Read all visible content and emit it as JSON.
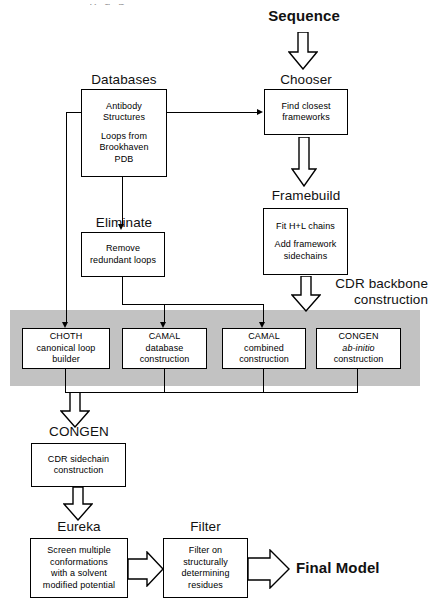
{
  "diagram": {
    "grey_band_label": "CDR backbone\nconstruction",
    "colors": {
      "band": "#c2c2c2",
      "line": "#000000",
      "box_fill": "#ffffff",
      "text": "#000000"
    }
  },
  "start": {
    "label": "Sequence"
  },
  "end": {
    "label": "Final Model"
  },
  "band": {
    "label_line1": "CDR backbone",
    "label_line2": "construction"
  },
  "stages": {
    "databases": {
      "caption": "Databases",
      "body_line1": "Antibody",
      "body_line2": "Structures",
      "body_line3": "Loops from",
      "body_line4": "Brookhaven",
      "body_line5": "PDB"
    },
    "chooser": {
      "caption": "Chooser",
      "body_line1": "Find closest",
      "body_line2": "frameworks"
    },
    "framebuild": {
      "caption": "Framebuild",
      "body_line1": "Fit H+L chains",
      "body_line2": "Add framework",
      "body_line3": "sidechains"
    },
    "eliminate": {
      "caption": "Eliminate",
      "body_line1": "Remove",
      "body_line2": "redundant loops"
    },
    "choth": {
      "body_line1": "CHOTH",
      "body_line2": "canonical loop",
      "body_line3": "builder"
    },
    "camal_database": {
      "body_line1": "CAMAL",
      "body_line2": "database",
      "body_line3": "construction"
    },
    "camal_combined": {
      "body_line1": "CAMAL",
      "body_line2": "combined",
      "body_line3": "construction"
    },
    "congen_abinitio": {
      "body_line1": "CONGEN",
      "body_line2": "ab-initio",
      "body_line3": "construction"
    },
    "congen_sidechain": {
      "caption": "CONGEN",
      "body_line1": "CDR sidechain",
      "body_line2": "construction"
    },
    "eureka": {
      "caption": "Eureka",
      "body_line1": "Screen multiple",
      "body_line2": "conformations",
      "body_line3": "with a solvent",
      "body_line4": "modified  potential"
    },
    "filter": {
      "caption": "Filter",
      "body_line1": "Filter on",
      "body_line2": "structurally",
      "body_line3": "determining",
      "body_line4": "residues"
    }
  }
}
